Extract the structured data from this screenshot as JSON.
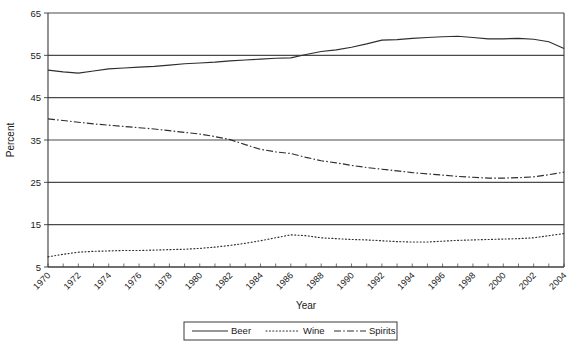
{
  "chart_data": {
    "type": "line",
    "title": "",
    "xlabel": "Year",
    "ylabel": "Percent",
    "xlim": [
      1970,
      2004
    ],
    "ylim": [
      5,
      65
    ],
    "ytick_labels": [
      "5",
      "15",
      "25",
      "35",
      "45",
      "55",
      "65"
    ],
    "yticks": [
      5,
      15,
      25,
      35,
      45,
      55,
      65
    ],
    "grid": "horizontal",
    "legend_position": "bottom-center",
    "x": [
      1970,
      1971,
      1972,
      1973,
      1974,
      1975,
      1976,
      1977,
      1978,
      1979,
      1980,
      1981,
      1982,
      1983,
      1984,
      1985,
      1986,
      1987,
      1988,
      1989,
      1990,
      1991,
      1992,
      1993,
      1994,
      1995,
      1996,
      1997,
      1998,
      1999,
      2000,
      2001,
      2002,
      2003,
      2004
    ],
    "xtick_labels": [
      "1970",
      "1972",
      "1974",
      "1976",
      "1978",
      "1980",
      "1982",
      "1984",
      "1986",
      "1988",
      "1990",
      "1992",
      "1994",
      "1996",
      "1998",
      "2000",
      "2002",
      "2004"
    ],
    "series": [
      {
        "name": "Beer",
        "style": "solid",
        "values": [
          51.5,
          51.1,
          50.8,
          51.3,
          51.8,
          52.0,
          52.2,
          52.4,
          52.7,
          53.0,
          53.2,
          53.4,
          53.7,
          53.9,
          54.1,
          54.3,
          54.4,
          55.2,
          55.9,
          56.3,
          56.9,
          57.7,
          58.6,
          58.7,
          59.0,
          59.2,
          59.4,
          59.5,
          59.2,
          58.9,
          58.9,
          59.0,
          58.8,
          58.2,
          56.6
        ]
      },
      {
        "name": "Wine",
        "style": "dotted",
        "values": [
          7.4,
          8.0,
          8.5,
          8.7,
          8.8,
          8.9,
          8.9,
          9.0,
          9.1,
          9.2,
          9.4,
          9.7,
          10.1,
          10.6,
          11.2,
          11.9,
          12.6,
          12.4,
          11.9,
          11.7,
          11.5,
          11.4,
          11.2,
          11.0,
          10.9,
          10.9,
          11.1,
          11.3,
          11.4,
          11.5,
          11.6,
          11.7,
          11.9,
          12.4,
          12.9
        ]
      },
      {
        "name": "Spirits",
        "style": "dashdot",
        "values": [
          40.0,
          39.6,
          39.2,
          38.8,
          38.5,
          38.2,
          37.9,
          37.6,
          37.2,
          36.8,
          36.4,
          35.8,
          35.1,
          33.9,
          32.8,
          32.2,
          31.8,
          30.9,
          30.1,
          29.6,
          29.0,
          28.5,
          28.1,
          27.7,
          27.3,
          27.0,
          26.7,
          26.4,
          26.2,
          26.0,
          26.0,
          26.1,
          26.3,
          26.8,
          27.4
        ]
      }
    ]
  },
  "legend": {
    "items": [
      {
        "label": "Beer"
      },
      {
        "label": "Wine"
      },
      {
        "label": "Spirits"
      }
    ]
  },
  "colors": {
    "line": "#2e2e2e",
    "axis": "#3a3a3a",
    "background": "#ffffff"
  }
}
